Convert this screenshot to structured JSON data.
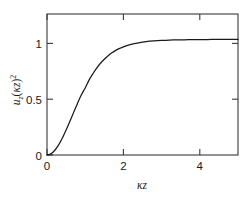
{
  "chart_data": {
    "type": "line",
    "title": "",
    "xlabel": "κz",
    "ylabel": "u_z(κz)²",
    "xlabel_parts": {
      "kappa": "κ",
      "z": "z"
    },
    "ylabel_parts": {
      "u": "u",
      "sub_z": "z",
      "open_paren": "(",
      "kappa": "κ",
      "z": "z",
      "close_paren": ")",
      "superscript": "2"
    },
    "xlim": [
      0,
      5
    ],
    "ylim": [
      0,
      1.22
    ],
    "xticks": [
      0,
      2,
      4
    ],
    "xtick_labels": [
      "0",
      "2",
      "4"
    ],
    "yticks": [
      0,
      0.5,
      1
    ],
    "ytick_labels": [
      "0",
      "0.5",
      "1"
    ],
    "grid": false,
    "legend": null,
    "frame": "box",
    "tick_direction": "in",
    "curve_color": "#1a1a1a",
    "axis_color": "#3a3a3a",
    "background_color": "#ffffff",
    "series": [
      {
        "name": "u_z(κz)²",
        "description": "Saturating sigmoid (tanh-squared) profile rising from 0 at κz=0 to asymptote 1",
        "x": [
          0.0,
          0.1,
          0.2,
          0.3,
          0.4,
          0.5,
          0.6,
          0.7,
          0.8,
          0.9,
          1.0,
          1.1,
          1.2,
          1.3,
          1.4,
          1.5,
          1.6,
          1.7,
          1.8,
          1.9,
          2.0,
          2.2,
          2.4,
          2.6,
          2.8,
          3.0,
          3.2,
          3.4,
          3.6,
          3.8,
          4.0,
          4.2,
          4.4,
          4.6,
          4.8,
          5.0
        ],
        "y": [
          0.0,
          0.01,
          0.039,
          0.085,
          0.145,
          0.216,
          0.292,
          0.371,
          0.448,
          0.521,
          0.58,
          0.648,
          0.703,
          0.752,
          0.794,
          0.829,
          0.859,
          0.884,
          0.905,
          0.922,
          0.936,
          0.957,
          0.971,
          0.981,
          0.987,
          0.991,
          0.994,
          0.996,
          0.997,
          0.998,
          0.999,
          0.999,
          1.0,
          1.0,
          1.0,
          1.0
        ]
      }
    ]
  }
}
